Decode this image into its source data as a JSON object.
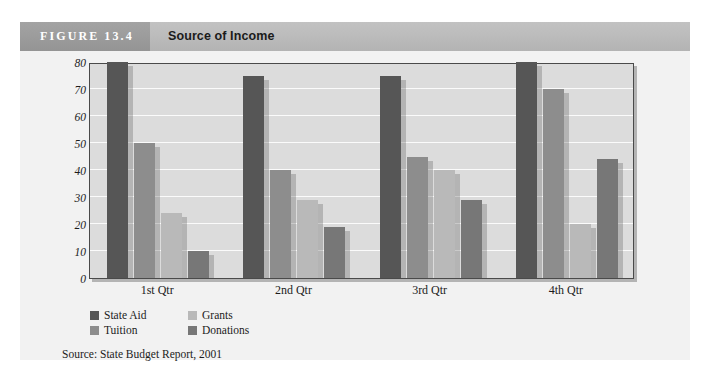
{
  "figure": {
    "number_label": "FIGURE 13.4",
    "title": "Source of Income",
    "source_note": "Source: State Budget Report, 2001"
  },
  "colors": {
    "state_aid": "#565656",
    "tuition": "#8d8d8d",
    "grants": "#b9b9b9",
    "donations": "#777777",
    "plot_background": "#dcdcdc",
    "gridline": "#fbfbfb",
    "panel_background": "#f2f2f2",
    "header_band": "#bcbcbc",
    "figure_number_block": "#9c9c9c",
    "plot_border": "#4a4a4a"
  },
  "chart_data": {
    "type": "bar",
    "title": "Source of Income",
    "xlabel": "",
    "ylabel": "",
    "ylim": [
      0,
      80
    ],
    "yticks": [
      0,
      10,
      20,
      30,
      40,
      50,
      60,
      70,
      80
    ],
    "ytick_labels": [
      "0",
      "10",
      "20",
      "30",
      "40",
      "50",
      "60",
      "70",
      "80"
    ],
    "grid": true,
    "grid_axis": "y",
    "legend_position": "below-left",
    "categories": [
      "1st Qtr",
      "2nd Qtr",
      "3rd Qtr",
      "4th Qtr"
    ],
    "series": [
      {
        "name": "State Aid",
        "color": "#565656",
        "values": [
          80,
          75,
          75,
          80
        ]
      },
      {
        "name": "Tuition",
        "color": "#8d8d8d",
        "values": [
          50,
          40,
          45,
          70
        ]
      },
      {
        "name": "Grants",
        "color": "#b9b9b9",
        "values": [
          24,
          29,
          40,
          20
        ]
      },
      {
        "name": "Donations",
        "color": "#777777",
        "values": [
          10,
          19,
          29,
          44
        ]
      }
    ]
  }
}
